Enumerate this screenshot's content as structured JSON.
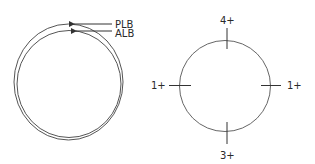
{
  "left_figure": {
    "labels": {
      "plb": "PLB",
      "alb": "ALB"
    }
  },
  "right_figure": {
    "labels": {
      "top": "4+",
      "left": "1+",
      "right": "1+",
      "bottom": "3+"
    }
  },
  "colors": {
    "stroke": "#4a4a4a",
    "text": "#2a2a2a"
  }
}
